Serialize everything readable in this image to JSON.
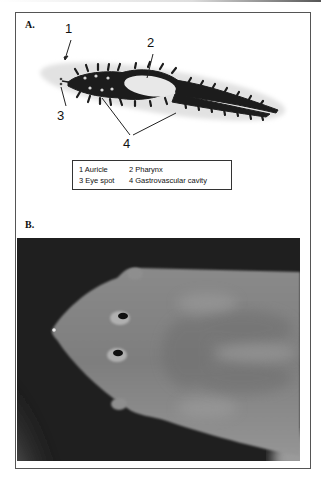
{
  "figure": {
    "panel_a": {
      "label": "A.",
      "callouts": [
        {
          "id": "1",
          "text": "1"
        },
        {
          "id": "2",
          "text": "2"
        },
        {
          "id": "3",
          "text": "3"
        },
        {
          "id": "4",
          "text": "4"
        }
      ],
      "legend": {
        "rows": [
          [
            {
              "num": "1",
              "text": "Auricle"
            },
            {
              "num": "2",
              "text": "Pharynx"
            }
          ],
          [
            {
              "num": "3",
              "text": "Eye spot"
            },
            {
              "num": "4",
              "text": "Gastrovascular cavity"
            }
          ]
        ],
        "row0_col0": "1  Auricle",
        "row0_col1": "2  Pharynx",
        "row1_col0": "3  Eye spot",
        "row1_col1": "4  Gastrovascular cavity"
      },
      "image_description": "Planarian flatworm, whole body with dark branched gastrovascular cavity"
    },
    "panel_b": {
      "label": "B.",
      "image_description": "Close-up photograph of planarian head showing two eye spots and auricles on dark background"
    },
    "colors": {
      "frame_border": "#555555",
      "worm_body": "#e4e4e4",
      "gut": "#1a1a1a",
      "photo_bg": "#1e1e1e",
      "photo_worm": "#8c8c8c"
    }
  }
}
